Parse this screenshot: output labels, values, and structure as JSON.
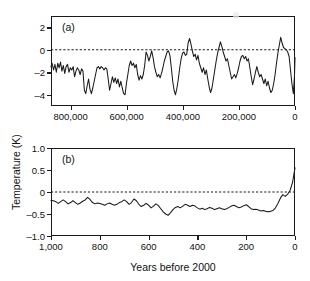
{
  "figure": {
    "axis_title_y": "Temperature (K)",
    "axis_title_x": "Years before 2000",
    "line_color": "#1a1a1a",
    "background": "#ffffff"
  },
  "panel_a": {
    "label": "(a)",
    "y_ticks": [
      "2",
      "0",
      "–2",
      "–4"
    ],
    "x_ticks": [
      "800,000",
      "600,000",
      "400,000",
      "200,000",
      "0"
    ]
  },
  "panel_b": {
    "label": "(b)",
    "y_ticks": [
      "1.0",
      "0.5",
      "0",
      "–0.5",
      "–1.0"
    ],
    "x_ticks": [
      "1,000",
      "800",
      "600",
      "400",
      "200",
      "0"
    ]
  },
  "chart_data": [
    {
      "type": "line",
      "id": "panel-a",
      "title": "(a)",
      "xlabel": "Years before 2000",
      "ylabel": "Temperature (K)",
      "xlim": [
        870000,
        0
      ],
      "ylim": [
        -5,
        3
      ],
      "x_ticks": [
        800000,
        600000,
        400000,
        200000,
        0
      ],
      "y_ticks": [
        2,
        0,
        -2,
        -4
      ],
      "grid": false,
      "legend": "none",
      "annotations": [
        {
          "text": "zero reference line",
          "type": "dashed-horizontal",
          "y": 0
        }
      ],
      "x": [
        870000,
        866000,
        861000,
        856000,
        851000,
        846000,
        841000,
        836000,
        831000,
        826000,
        821000,
        816000,
        811000,
        806000,
        801000,
        796000,
        791000,
        786000,
        781000,
        776000,
        771000,
        766000,
        761000,
        756000,
        751000,
        746000,
        741000,
        736000,
        731000,
        726000,
        721000,
        716000,
        711000,
        706000,
        701000,
        696000,
        691000,
        686000,
        681000,
        676000,
        671000,
        666000,
        661000,
        656000,
        651000,
        646000,
        641000,
        636000,
        631000,
        626000,
        621000,
        616000,
        611000,
        606000,
        601000,
        596000,
        591000,
        586000,
        581000,
        576000,
        571000,
        566000,
        561000,
        556000,
        551000,
        546000,
        541000,
        536000,
        531000,
        526000,
        521000,
        516000,
        511000,
        506000,
        501000,
        496000,
        491000,
        486000,
        481000,
        476000,
        471000,
        466000,
        461000,
        456000,
        451000,
        446000,
        441000,
        436000,
        431000,
        426000,
        421000,
        416000,
        411000,
        406000,
        401000,
        396000,
        391000,
        386000,
        381000,
        376000,
        371000,
        366000,
        361000,
        356000,
        351000,
        346000,
        341000,
        336000,
        331000,
        326000,
        321000,
        316000,
        311000,
        306000,
        301000,
        296000,
        291000,
        286000,
        281000,
        276000,
        271000,
        266000,
        261000,
        256000,
        251000,
        246000,
        241000,
        236000,
        231000,
        226000,
        221000,
        216000,
        211000,
        206000,
        201000,
        196000,
        191000,
        186000,
        181000,
        176000,
        171000,
        166000,
        161000,
        156000,
        151000,
        146000,
        141000,
        136000,
        131000,
        126000,
        121000,
        116000,
        111000,
        106000,
        101000,
        96000,
        91000,
        86000,
        81000,
        76000,
        71000,
        66000,
        61000,
        56000,
        51000,
        46000,
        41000,
        36000,
        31000,
        26000,
        21000,
        16000,
        11000,
        6000,
        2000,
        0
      ],
      "y": [
        -1.5,
        -1.2,
        -1.8,
        -1.3,
        -2.0,
        -1.2,
        -1.6,
        -1.1,
        -1.9,
        -1.4,
        -2.1,
        -1.5,
        -1.3,
        -2.0,
        -1.6,
        -1.8,
        -1.5,
        -2.4,
        -1.9,
        -1.6,
        -1.8,
        -2.2,
        -1.7,
        -1.9,
        -3.6,
        -3.9,
        -3.2,
        -2.6,
        -3.5,
        -3.9,
        -3.4,
        -2.8,
        -2.2,
        -1.6,
        -1.5,
        -1.7,
        -1.5,
        -1.6,
        -1.8,
        -1.6,
        -1.7,
        -2.6,
        -3.6,
        -3.0,
        -2.4,
        -2.9,
        -2.5,
        -3.0,
        -2.6,
        -3.3,
        -2.8,
        -3.4,
        -3.9,
        -4.0,
        -3.0,
        -2.2,
        -1.4,
        -1.0,
        -1.4,
        -1.2,
        -1.6,
        -1.3,
        -2.2,
        -2.7,
        -2.3,
        -2.6,
        -2.2,
        -1.4,
        -0.2,
        -0.5,
        -1.0,
        -0.6,
        -0.1,
        -0.7,
        -1.5,
        -2.0,
        -2.4,
        -2.2,
        -2.5,
        -2.1,
        -1.6,
        -1.0,
        -0.6,
        -0.2,
        -0.1,
        -0.5,
        -1.6,
        -2.8,
        -3.6,
        -4.0,
        -3.4,
        -2.6,
        -1.6,
        -0.8,
        -0.3,
        -0.2,
        -0.5,
        -0.4,
        0.6,
        1.0,
        0.5,
        -0.1,
        -0.6,
        -0.4,
        -0.9,
        -0.5,
        -1.2,
        -1.6,
        -2.0,
        -1.6,
        -2.2,
        -1.8,
        -2.6,
        -3.3,
        -3.8,
        -3.4,
        -2.6,
        -1.8,
        -1.0,
        -0.3,
        0.2,
        0.7,
        0.3,
        -0.2,
        -0.6,
        -1.0,
        -0.8,
        -1.4,
        -2.0,
        -2.6,
        -2.4,
        -2.2,
        -2.5,
        -2.1,
        -1.6,
        -1.0,
        -0.6,
        -0.5,
        -0.8,
        -0.6,
        -1.0,
        -0.8,
        -1.6,
        -2.4,
        -3.1,
        -2.6,
        -2.0,
        -1.5,
        -2.0,
        -2.4,
        -2.2,
        -2.6,
        -3.0,
        -2.6,
        -3.2,
        -2.8,
        -3.4,
        -3.8,
        -3.6,
        -3.0,
        -2.2,
        -1.2,
        -0.3,
        0.4,
        1.1,
        0.6,
        0.2,
        0.1,
        0.0,
        -0.2,
        -0.6,
        -1.8,
        -3.0,
        -3.9,
        -2.4,
        -0.7
      ]
    },
    {
      "type": "line",
      "id": "panel-b",
      "title": "(b)",
      "xlabel": "Years before 2000",
      "ylabel": "Temperature (K)",
      "xlim": [
        1000,
        0
      ],
      "ylim": [
        -1.0,
        1.0
      ],
      "x_ticks": [
        1000,
        800,
        600,
        400,
        200,
        0
      ],
      "y_ticks": [
        1.0,
        0.5,
        0,
        -0.5,
        -1.0
      ],
      "grid": false,
      "legend": "none",
      "annotations": [
        {
          "text": "zero reference line",
          "type": "dashed-horizontal",
          "y": 0
        }
      ],
      "x": [
        1000,
        990,
        980,
        970,
        960,
        950,
        940,
        930,
        920,
        910,
        900,
        890,
        880,
        870,
        860,
        850,
        840,
        830,
        820,
        810,
        800,
        790,
        780,
        770,
        760,
        750,
        740,
        730,
        720,
        710,
        700,
        690,
        680,
        670,
        660,
        650,
        640,
        630,
        620,
        610,
        600,
        590,
        580,
        570,
        560,
        550,
        540,
        530,
        520,
        510,
        500,
        490,
        480,
        470,
        460,
        450,
        440,
        430,
        420,
        410,
        400,
        390,
        380,
        370,
        360,
        350,
        340,
        330,
        320,
        310,
        300,
        290,
        280,
        270,
        260,
        250,
        240,
        230,
        220,
        210,
        200,
        190,
        180,
        170,
        160,
        150,
        140,
        130,
        120,
        110,
        100,
        90,
        80,
        70,
        60,
        50,
        40,
        30,
        20,
        10,
        0
      ],
      "y": [
        -0.19,
        -0.2,
        -0.22,
        -0.26,
        -0.22,
        -0.18,
        -0.22,
        -0.27,
        -0.24,
        -0.2,
        -0.24,
        -0.28,
        -0.25,
        -0.21,
        -0.18,
        -0.12,
        -0.17,
        -0.24,
        -0.27,
        -0.25,
        -0.26,
        -0.28,
        -0.3,
        -0.27,
        -0.25,
        -0.28,
        -0.3,
        -0.28,
        -0.24,
        -0.22,
        -0.18,
        -0.22,
        -0.28,
        -0.24,
        -0.16,
        -0.2,
        -0.28,
        -0.33,
        -0.3,
        -0.26,
        -0.3,
        -0.36,
        -0.32,
        -0.27,
        -0.31,
        -0.38,
        -0.45,
        -0.5,
        -0.53,
        -0.47,
        -0.4,
        -0.35,
        -0.33,
        -0.36,
        -0.32,
        -0.28,
        -0.3,
        -0.33,
        -0.3,
        -0.32,
        -0.36,
        -0.39,
        -0.37,
        -0.4,
        -0.38,
        -0.35,
        -0.37,
        -0.4,
        -0.38,
        -0.36,
        -0.38,
        -0.4,
        -0.38,
        -0.35,
        -0.32,
        -0.3,
        -0.33,
        -0.36,
        -0.34,
        -0.31,
        -0.29,
        -0.33,
        -0.38,
        -0.4,
        -0.39,
        -0.41,
        -0.43,
        -0.42,
        -0.44,
        -0.45,
        -0.44,
        -0.42,
        -0.36,
        -0.26,
        -0.14,
        -0.06,
        -0.1,
        -0.05,
        0.04,
        0.22,
        0.55
      ]
    }
  ]
}
